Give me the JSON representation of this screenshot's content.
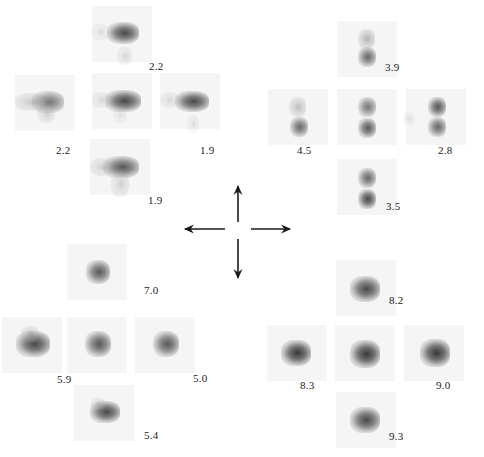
{
  "figure": {
    "panels": [
      {
        "name": "left-top-cross",
        "spots": [
          {
            "id": "lt-top",
            "cx": 122,
            "cy": 34,
            "label": "2.2",
            "lx": 149,
            "ly": 66,
            "blobs": [
              {
                "x": 110,
                "y": 25,
                "w": 26,
                "h": 16,
                "d": 0.85
              },
              {
                "x": 94,
                "y": 27,
                "w": 12,
                "h": 10,
                "d": 0.2
              },
              {
                "x": 120,
                "y": 50,
                "w": 9,
                "h": 12,
                "d": 0.25
              }
            ]
          },
          {
            "id": "lt-left",
            "cx": 45,
            "cy": 103,
            "label": "2.2",
            "lx": 56,
            "ly": 150,
            "blobs": [
              {
                "x": 35,
                "y": 94,
                "w": 26,
                "h": 16,
                "d": 0.7
              },
              {
                "x": 18,
                "y": 96,
                "w": 24,
                "h": 12,
                "d": 0.35
              },
              {
                "x": 40,
                "y": 108,
                "w": 12,
                "h": 12,
                "d": 0.3
              }
            ]
          },
          {
            "id": "lt-center",
            "cx": 122,
            "cy": 101,
            "label": "",
            "lx": 0,
            "ly": 0,
            "blobs": [
              {
                "x": 108,
                "y": 93,
                "w": 30,
                "h": 16,
                "d": 0.85
              },
              {
                "x": 95,
                "y": 95,
                "w": 12,
                "h": 10,
                "d": 0.25
              },
              {
                "x": 116,
                "y": 110,
                "w": 8,
                "h": 10,
                "d": 0.2
              }
            ]
          },
          {
            "id": "lt-right",
            "cx": 190,
            "cy": 101,
            "label": "1.9",
            "lx": 200,
            "ly": 150,
            "blobs": [
              {
                "x": 178,
                "y": 94,
                "w": 28,
                "h": 15,
                "d": 0.85
              },
              {
                "x": 163,
                "y": 95,
                "w": 12,
                "h": 10,
                "d": 0.25
              },
              {
                "x": 190,
                "y": 118,
                "w": 6,
                "h": 12,
                "d": 0.2
              }
            ]
          },
          {
            "id": "lt-bottom",
            "cx": 120,
            "cy": 167,
            "label": "1.9",
            "lx": 148,
            "ly": 200,
            "blobs": [
              {
                "x": 106,
                "y": 159,
                "w": 30,
                "h": 16,
                "d": 0.8
              },
              {
                "x": 93,
                "y": 161,
                "w": 16,
                "h": 12,
                "d": 0.3
              },
              {
                "x": 114,
                "y": 174,
                "w": 12,
                "h": 20,
                "d": 0.3
              }
            ]
          }
        ]
      },
      {
        "name": "right-top-cross",
        "spots": [
          {
            "id": "rt-top",
            "cx": 367,
            "cy": 49,
            "label": "3.9",
            "lx": 385,
            "ly": 67,
            "blobs": [
              {
                "x": 361,
                "y": 32,
                "w": 11,
                "h": 14,
                "d": 0.45
              },
              {
                "x": 361,
                "y": 50,
                "w": 12,
                "h": 14,
                "d": 0.75
              }
            ]
          },
          {
            "id": "rt-left",
            "cx": 298,
            "cy": 117,
            "label": "4.5",
            "lx": 297,
            "ly": 150,
            "blobs": [
              {
                "x": 292,
                "y": 100,
                "w": 11,
                "h": 14,
                "d": 0.4
              },
              {
                "x": 293,
                "y": 120,
                "w": 12,
                "h": 14,
                "d": 0.75
              }
            ]
          },
          {
            "id": "rt-center",
            "cx": 367,
            "cy": 117,
            "label": "",
            "lx": 0,
            "ly": 0,
            "blobs": [
              {
                "x": 361,
                "y": 100,
                "w": 12,
                "h": 14,
                "d": 0.7
              },
              {
                "x": 361,
                "y": 121,
                "w": 12,
                "h": 14,
                "d": 0.8
              }
            ]
          },
          {
            "id": "rt-right",
            "cx": 436,
            "cy": 117,
            "label": "2.8",
            "lx": 438,
            "ly": 150,
            "blobs": [
              {
                "x": 431,
                "y": 100,
                "w": 12,
                "h": 14,
                "d": 0.8
              },
              {
                "x": 431,
                "y": 120,
                "w": 12,
                "h": 14,
                "d": 0.75
              },
              {
                "x": 406,
                "y": 115,
                "w": 6,
                "h": 7,
                "d": 0.2
              }
            ]
          },
          {
            "id": "rt-bottom",
            "cx": 367,
            "cy": 187,
            "label": "3.5",
            "lx": 386,
            "ly": 206,
            "blobs": [
              {
                "x": 361,
                "y": 171,
                "w": 12,
                "h": 14,
                "d": 0.75
              },
              {
                "x": 361,
                "y": 192,
                "w": 12,
                "h": 14,
                "d": 0.85
              }
            ]
          }
        ]
      },
      {
        "name": "left-bottom-cross",
        "spots": [
          {
            "id": "lb-top",
            "cx": 97,
            "cy": 272,
            "label": "7.0",
            "lx": 144,
            "ly": 290,
            "blobs": [
              {
                "x": 89,
                "y": 263,
                "w": 18,
                "h": 18,
                "d": 0.8
              }
            ]
          },
          {
            "id": "lb-left",
            "cx": 32,
            "cy": 345,
            "label": "5.9",
            "lx": 57,
            "ly": 379,
            "blobs": [
              {
                "x": 19,
                "y": 334,
                "w": 28,
                "h": 20,
                "d": 0.85
              },
              {
                "x": 24,
                "y": 329,
                "w": 12,
                "h": 10,
                "d": 0.35
              }
            ]
          },
          {
            "id": "lb-center",
            "cx": 97,
            "cy": 345,
            "label": "",
            "lx": 0,
            "ly": 0,
            "blobs": [
              {
                "x": 88,
                "y": 334,
                "w": 20,
                "h": 20,
                "d": 0.8
              }
            ]
          },
          {
            "id": "lb-right",
            "cx": 165,
            "cy": 345,
            "label": "5.0",
            "lx": 193,
            "ly": 378,
            "blobs": [
              {
                "x": 156,
                "y": 334,
                "w": 20,
                "h": 20,
                "d": 0.8
              }
            ]
          },
          {
            "id": "lb-bottom",
            "cx": 104,
            "cy": 413,
            "label": "5.4",
            "lx": 144,
            "ly": 435,
            "blobs": [
              {
                "x": 93,
                "y": 404,
                "w": 24,
                "h": 16,
                "d": 0.85
              },
              {
                "x": 94,
                "y": 401,
                "w": 8,
                "h": 6,
                "d": 0.3
              }
            ]
          }
        ]
      },
      {
        "name": "right-bottom-cross",
        "spots": [
          {
            "id": "rb-top",
            "cx": 366,
            "cy": 288,
            "label": "8.2",
            "lx": 389,
            "ly": 300,
            "blobs": [
              {
                "x": 353,
                "y": 279,
                "w": 24,
                "h": 20,
                "d": 0.85
              }
            ]
          },
          {
            "id": "rb-left",
            "cx": 297,
            "cy": 353,
            "label": "8.3",
            "lx": 300,
            "ly": 385,
            "blobs": [
              {
                "x": 284,
                "y": 343,
                "w": 24,
                "h": 20,
                "d": 0.9
              }
            ]
          },
          {
            "id": "rb-center",
            "cx": 365,
            "cy": 353,
            "label": "",
            "lx": 0,
            "ly": 0,
            "blobs": [
              {
                "x": 353,
                "y": 343,
                "w": 24,
                "h": 22,
                "d": 0.9
              }
            ]
          },
          {
            "id": "rb-right",
            "cx": 434,
            "cy": 353,
            "label": "9.0",
            "lx": 436,
            "ly": 385,
            "blobs": [
              {
                "x": 423,
                "y": 342,
                "w": 24,
                "h": 22,
                "d": 0.9
              }
            ]
          },
          {
            "id": "rb-bottom",
            "cx": 366,
            "cy": 420,
            "label": "9.3",
            "lx": 389,
            "ly": 436,
            "blobs": [
              {
                "x": 353,
                "y": 410,
                "w": 24,
                "h": 20,
                "d": 0.85
              }
            ]
          }
        ]
      }
    ],
    "arrows": {
      "center_x": 238,
      "center_y": 229,
      "up": {
        "x1": 238,
        "y1": 222,
        "x2": 238,
        "y2": 186
      },
      "down": {
        "x1": 238,
        "y1": 239,
        "x2": 238,
        "y2": 278
      },
      "left": {
        "x1": 225,
        "y1": 229,
        "x2": 185,
        "y2": 229
      },
      "right": {
        "x1": 251,
        "y1": 229,
        "x2": 290,
        "y2": 229
      },
      "color": "#1a1a1a"
    },
    "colors": {
      "spot_core": "#2b2b2b",
      "spot_halo": "#bfbfbf",
      "label": "#222222",
      "background": "#ffffff"
    }
  }
}
